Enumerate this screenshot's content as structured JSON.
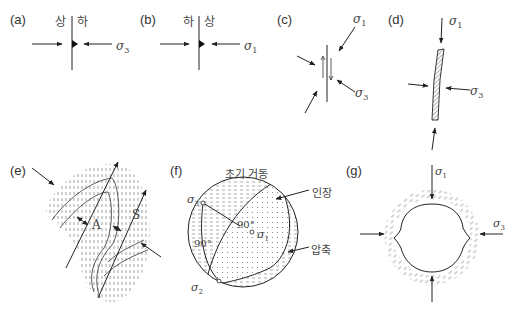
{
  "panels": {
    "a": {
      "label": "(a)",
      "left_side": "상",
      "right_side": "하",
      "stress": "σ",
      "stress_sub": "3"
    },
    "b": {
      "label": "(b)",
      "left_side": "하",
      "right_side": "상",
      "stress": "σ",
      "stress_sub": "1"
    },
    "c": {
      "label": "(c)",
      "stress1": "σ",
      "stress1_sub": "1",
      "stress3": "σ",
      "stress3_sub": "3"
    },
    "d": {
      "label": "(d)",
      "stress1": "σ",
      "stress1_sub": "1",
      "stress3": "σ",
      "stress3_sub": "3"
    },
    "e": {
      "label": "(e)",
      "antiform_label": "A",
      "synform_label": "S"
    },
    "f": {
      "label": "(f)",
      "title": "초기 거동",
      "tension_label": "인장",
      "compression_label": "압축",
      "angle1": "90°",
      "angle2": "90°",
      "sigma1": "σ",
      "sigma1_sub": "1",
      "sigma2": "σ",
      "sigma2_sub": "2",
      "sigma3": "σ",
      "sigma3_sub": "3"
    },
    "g": {
      "label": "(g)",
      "stress1": "σ",
      "stress1_sub": "1",
      "stress3": "σ",
      "stress3_sub": "3"
    }
  },
  "colors": {
    "line": "#222222",
    "text": "#444444",
    "hatch": "#888888"
  }
}
